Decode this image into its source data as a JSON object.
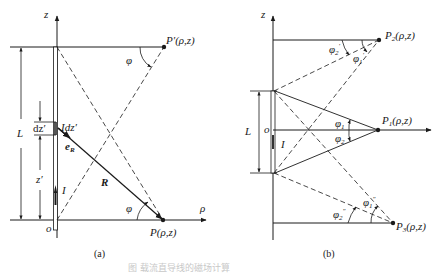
{
  "figure": {
    "caption": "图 载流直导线的磁场计算",
    "panel_a": {
      "label": "(a)",
      "axis_z": "z",
      "axis_rho": "ρ",
      "origin": "o",
      "length": "L",
      "element_length": "dz′",
      "current_element": "Idz′",
      "unit_vector": "e",
      "unit_vector_sub": "R",
      "distance_vector": "R",
      "position": "z′",
      "current": "I",
      "angle_top": "φ",
      "angle_bottom": "φ",
      "point_top": "P′(ρ,z)",
      "point_bottom": "P(ρ,z)"
    },
    "panel_b": {
      "label": "(b)",
      "axis_z": "z",
      "origin": "o",
      "length": "L",
      "current": "I",
      "point_1": "P",
      "point_1_sub": "1",
      "point_1_coords": "(ρ,z)",
      "point_2": "P",
      "point_2_sub": "2",
      "point_2_coords": "(ρ,z)",
      "point_3": "P",
      "point_3_sub": "3",
      "point_3_coords": "(ρ,z)",
      "phi": "φ",
      "angle_p1_upper_sub": "1",
      "angle_p1_lower_sub": "2",
      "angle_p2_a_sub": "2",
      "angle_p2_a_sup": "′",
      "angle_p2_b_sub": "1",
      "angle_p2_b_sup": "′",
      "angle_p3_a_sub": "2",
      "angle_p3_a_sup": "″",
      "angle_p3_b_sub": "1",
      "angle_p3_b_sup": "″"
    }
  }
}
